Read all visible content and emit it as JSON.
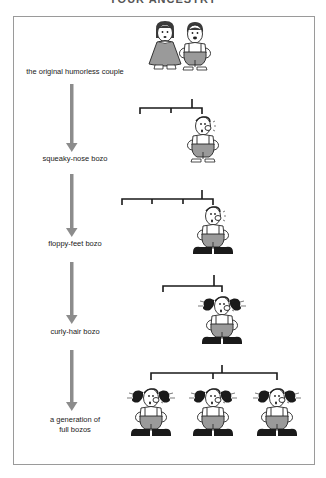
{
  "title": "YOUR ANCESTRY",
  "stages": [
    {
      "label": "the original humorless couple"
    },
    {
      "label": "squeaky-nose bozo"
    },
    {
      "label": "floppy-feet bozo"
    },
    {
      "label": "curly-hair bozo"
    },
    {
      "label": "a generation of",
      "label2": "full bozos"
    }
  ],
  "colors": {
    "arrow": "#8c8c8c",
    "line": "#1a1a1a",
    "body_fill": "#9a9a9a",
    "shoe": "#1a1a1a",
    "frame": "#9a9a9a"
  }
}
